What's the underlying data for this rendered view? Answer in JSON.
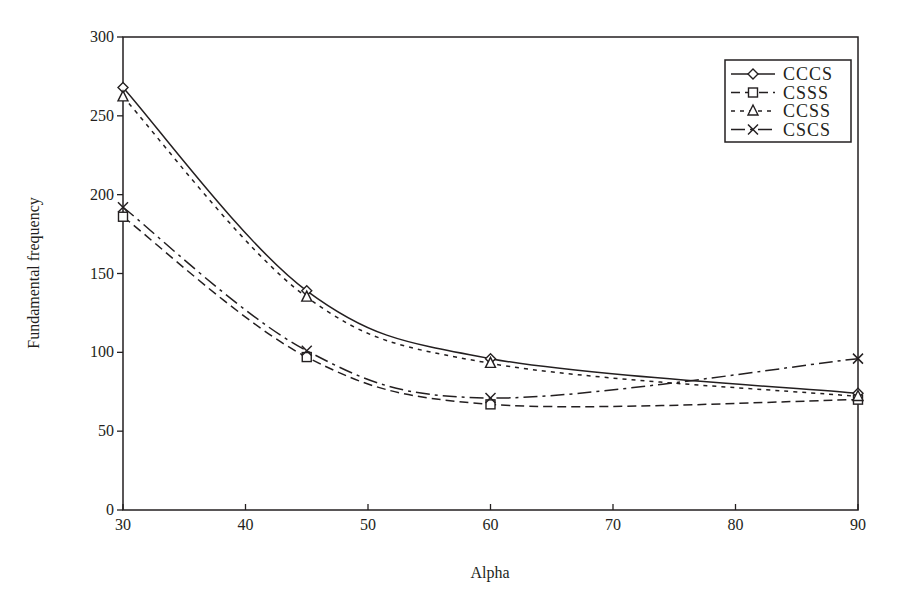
{
  "chart_data": {
    "type": "line",
    "title": "",
    "xlabel": "Alpha",
    "ylabel": "Fundamental frequency",
    "x": [
      30,
      45,
      60,
      90
    ],
    "xlim": [
      30,
      90
    ],
    "ylim": [
      0,
      300
    ],
    "xticks": [
      30,
      40,
      50,
      60,
      70,
      80,
      90
    ],
    "yticks": [
      0,
      50,
      100,
      150,
      200,
      250,
      300
    ],
    "grid": false,
    "legend_position": "upper right",
    "series": [
      {
        "name": "CCCS",
        "values": [
          268,
          139,
          96,
          74
        ],
        "marker": "diamond",
        "linestyle": "solid"
      },
      {
        "name": "CSSS",
        "values": [
          186,
          97,
          67,
          70
        ],
        "marker": "square",
        "linestyle": "dashed"
      },
      {
        "name": "CCSS",
        "values": [
          262,
          135,
          93,
          72
        ],
        "marker": "triangle",
        "linestyle": "dotted"
      },
      {
        "name": "CSCS",
        "values": [
          192,
          101,
          71,
          96
        ],
        "marker": "x",
        "linestyle": "dash-dot"
      }
    ]
  },
  "colors": {
    "ink": "#231f20",
    "background": "#ffffff"
  }
}
